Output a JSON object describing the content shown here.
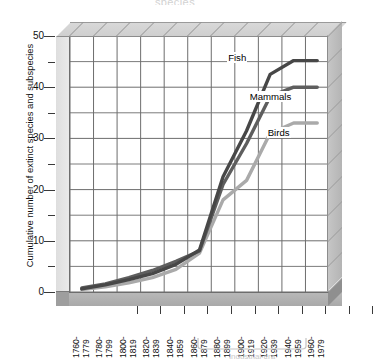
{
  "figure": {
    "title_faint": "species",
    "annotation_faint": "Industrial era"
  },
  "chart_data": {
    "type": "line",
    "title": "",
    "xlabel": "",
    "ylabel": "Cumulative number of extinct species and subspecies",
    "categories": [
      "1760-1779",
      "1780-1799",
      "1800-1819",
      "1820-1839",
      "1840-1859",
      "1860-1879",
      "1880-1899",
      "1900-1919",
      "1920-1939",
      "1940-1959",
      "1960-1979"
    ],
    "category_lines": [
      [
        "1760-",
        "1779"
      ],
      [
        "1780-",
        "1799"
      ],
      [
        "1800-",
        "1819"
      ],
      [
        "1820-",
        "1839"
      ],
      [
        "1840-",
        "1859"
      ],
      [
        "1860-",
        "1879"
      ],
      [
        "1880-",
        "1899"
      ],
      [
        "1900-",
        "1919"
      ],
      [
        "1920-",
        "1939"
      ],
      [
        "1940-",
        "1959"
      ],
      [
        "1960-",
        "1979"
      ]
    ],
    "ylim": [
      0,
      50
    ],
    "xlim_ticks": 11,
    "ytick_labels": [
      "0",
      "10",
      "20",
      "30",
      "40",
      "50"
    ],
    "ytick_values": [
      0,
      10,
      20,
      30,
      40,
      50
    ],
    "yminor_values": [
      5,
      15,
      25,
      35,
      45
    ],
    "grid": true,
    "legend_position": "inline-end-labels",
    "series": [
      {
        "name": "Fish",
        "color": "#474747",
        "values": [
          0.6,
          1.4,
          2.4,
          3.6,
          5.4,
          8.2,
          22.5,
          31.5,
          42.5,
          45.2,
          45.2
        ]
      },
      {
        "name": "Mammals",
        "color": "#5e5e5e",
        "values": [
          0.8,
          1.6,
          2.8,
          4.2,
          6.0,
          8.0,
          21.0,
          29.0,
          38.2,
          40.0,
          40.0
        ]
      },
      {
        "name": "Birds",
        "color": "#aaaaaa",
        "values": [
          0.5,
          1.0,
          1.8,
          2.8,
          4.4,
          7.6,
          18.0,
          21.8,
          31.0,
          33.0,
          33.0
        ]
      }
    ]
  },
  "colors": {
    "fish": "#474747",
    "mammals": "#5e5e5e",
    "birds": "#aaaaaa",
    "grid": "#6d6d6d",
    "wall": "#dedede",
    "floor": "#b0b0b0"
  }
}
